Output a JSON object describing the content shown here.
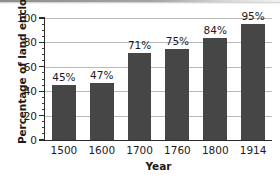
{
  "chart_data": {
    "type": "bar",
    "title": "",
    "xlabel": "Year",
    "ylabel": "Percentage of land enclosed",
    "categories": [
      "1500",
      "1600",
      "1700",
      "1760",
      "1800",
      "1914"
    ],
    "values": [
      45,
      47,
      71,
      75,
      84,
      95
    ],
    "value_labels": [
      "45%",
      "47%",
      "71%",
      "75%",
      "84%",
      "95%"
    ],
    "ylim": [
      0,
      100
    ],
    "ytick_labels": [
      "0",
      "20",
      "40",
      "60",
      "80",
      "100"
    ],
    "ytick_values": [
      0,
      20,
      40,
      60,
      80,
      100
    ],
    "yminor_step": 5,
    "grid": "horizontal",
    "legend": "none",
    "bar_color": "#464646",
    "gridline_color": "#b9b9b9",
    "axis_color": "#2a2a2a",
    "text_color": "#1b1b1b",
    "background_color": "#ffffff"
  }
}
